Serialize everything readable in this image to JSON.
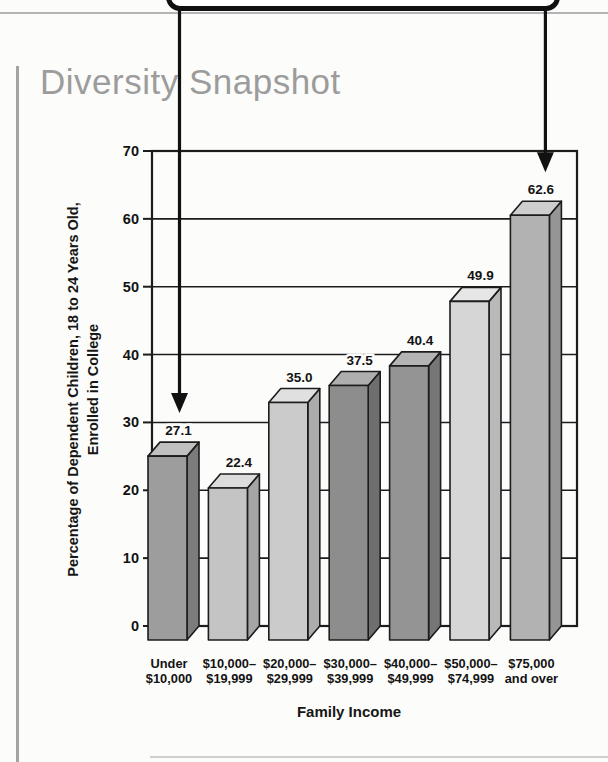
{
  "page": {
    "heading": "Diversity Snapshot"
  },
  "chart_data": {
    "type": "bar",
    "style": "3d-grayscale-columns",
    "title": "Diversity Snapshot",
    "xlabel": "Family Income",
    "ylabel_lines": [
      "Percentage of Dependent Children, 18 to 24 Years Old,",
      "Enrolled in College"
    ],
    "categories": [
      [
        "Under",
        "$10,000"
      ],
      [
        "$10,000–",
        "$19,999"
      ],
      [
        "$20,000–",
        "$29,999"
      ],
      [
        "$30,000–",
        "$39,999"
      ],
      [
        "$40,000–",
        "$49,999"
      ],
      [
        "$50,000–",
        "$74,999"
      ],
      [
        "$75,000",
        "and over"
      ]
    ],
    "values": [
      27.1,
      22.4,
      35.0,
      37.5,
      40.4,
      49.9,
      62.6
    ],
    "value_labels": [
      "27.1",
      "22.4",
      "35.0",
      "37.5",
      "40.4",
      "49.9",
      "62.6"
    ],
    "ylim": [
      0,
      70
    ],
    "yticks": [
      0,
      10,
      20,
      30,
      40,
      50,
      60,
      70
    ],
    "grid": true,
    "legend": "none",
    "bar_colors": {
      "front": [
        "#9d9d9d",
        "#c4c4c4",
        "#cbcbcb",
        "#8d8d8d",
        "#949494",
        "#d6d6d6",
        "#b2b2b2"
      ],
      "top": [
        "#c0c0c0",
        "#dcdcdc",
        "#e0e0e0",
        "#aeaeae",
        "#b4b4b4",
        "#e6e6e6",
        "#cecece"
      ],
      "side": [
        "#7c7c7c",
        "#a5a5a5",
        "#acacac",
        "#6e6e6e",
        "#767676",
        "#b9b9b9",
        "#959595"
      ]
    },
    "line_color": "#1c1c1c",
    "annotations": [
      {
        "shape": "down-arrow",
        "bar_index": 0
      },
      {
        "shape": "down-arrow",
        "bar_index": 6
      }
    ]
  }
}
